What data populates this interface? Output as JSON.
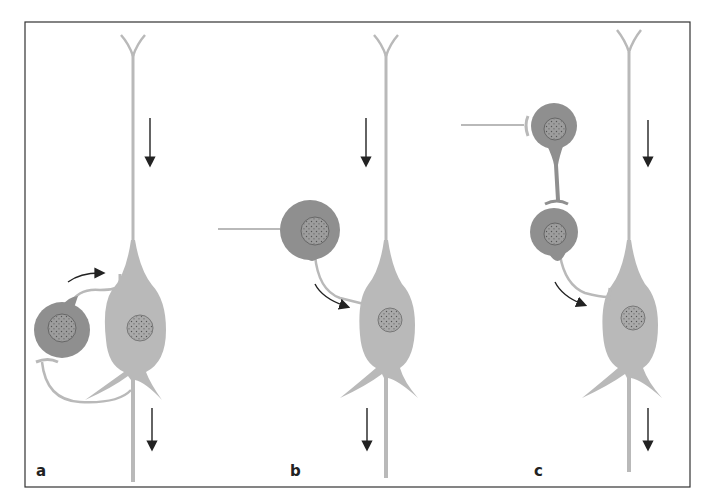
{
  "figure": {
    "panels": [
      {
        "id": "a",
        "label": "a",
        "description": "Pyramidal neuron with recurrent (feedback) inhibition via interneuron"
      },
      {
        "id": "b",
        "label": "b",
        "description": "Feed-forward inhibition: external input excites interneuron which inhibits pyramidal neuron"
      },
      {
        "id": "c",
        "label": "c",
        "description": "Disinhibition: external input inhibits interneuron that inhibits a second interneuron, which inhibits pyramidal neuron"
      }
    ],
    "colors": {
      "frame": "#333333",
      "pyramidal_cell": "#b9b9b9",
      "interneuron": "#8f8f8f",
      "nucleus": "#777777",
      "arrow": "#222222",
      "background": "#ffffff"
    }
  }
}
